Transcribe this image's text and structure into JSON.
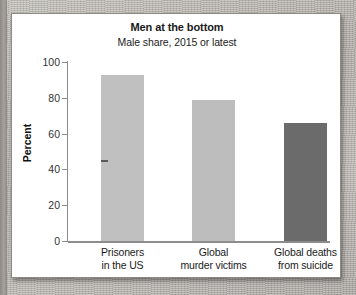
{
  "chart_data": {
    "type": "bar",
    "title": "Men at the bottom",
    "subtitle": "Male share, 2015 or latest",
    "xlabel": "",
    "ylabel": "Percent",
    "ylim": [
      0,
      100
    ],
    "yticks": [
      0,
      20,
      40,
      60,
      80,
      100
    ],
    "ytick_labels": [
      "0",
      "20",
      "40",
      "60",
      "80",
      "100"
    ],
    "grid": false,
    "legend": false,
    "categories": [
      "Prisoners in the US",
      "Global murder victims",
      "Global deaths from suicide"
    ],
    "category_lines": [
      [
        "Prisoners",
        "in the US"
      ],
      [
        "Global",
        "murder victims"
      ],
      [
        "Global deaths",
        "from suicide"
      ]
    ],
    "values": [
      93,
      79,
      66
    ],
    "bar_colors": [
      "#c0c0c0",
      "#bdbdbd",
      "#6b6b6b"
    ],
    "axis_color": "#8c8c8c",
    "text_color": "#1a1a1a",
    "background": "#ffffff"
  },
  "card": {
    "border_color": "#8e8b86"
  }
}
